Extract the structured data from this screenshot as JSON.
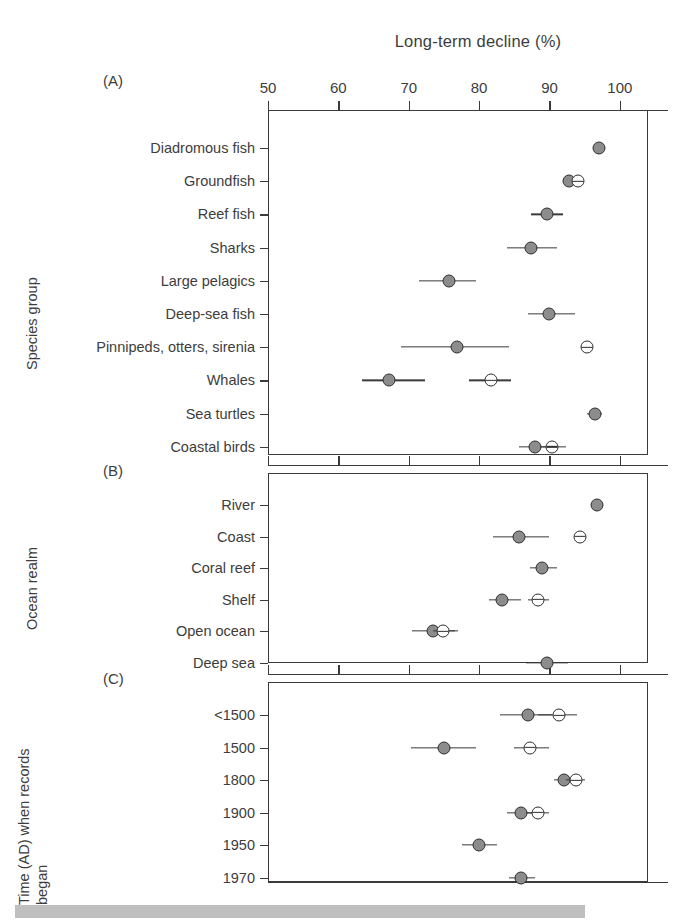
{
  "figure": {
    "title": "Long-term decline (%)",
    "panel_tags": {
      "a": "(A)",
      "b": "(B)",
      "c": "(C)"
    },
    "axis_titles": {
      "a": "Species group",
      "b": "Ocean realm",
      "c_line1": "Time (AD) when records",
      "c_line2": "began"
    }
  },
  "chart_data": {
    "type": "scatter",
    "title": "Long-term decline (%)",
    "xlabel": "Long-term decline (%)",
    "ylabel": "",
    "xlim": [
      50,
      104
    ],
    "xticks": [
      50,
      60,
      70,
      80,
      90,
      100
    ],
    "xtick_labels": [
      "50",
      "60",
      "70",
      "80",
      "90",
      "100"
    ],
    "grid": false,
    "legend": [
      {
        "name": "filled circle",
        "marker": "filled",
        "color": "#8c8c8c"
      },
      {
        "name": "open circle",
        "marker": "open",
        "color": "#ffffff"
      }
    ],
    "panels": [
      {
        "tag": "(A)",
        "ylabel": "Species group",
        "categories": [
          "Diadromous fish",
          "Groundfish",
          "Reef fish",
          "Sharks",
          "Large pelagics",
          "Deep-sea fish",
          "Pinnipeds, otters, sirenia",
          "Whales",
          "Sea turtles",
          "Coastal birds"
        ],
        "series": [
          {
            "name": "filled",
            "points": [
              {
                "category": "Diadromous fish",
                "value": 97.0,
                "lo": 97.0,
                "hi": 97.0
              },
              {
                "category": "Groundfish",
                "value": 92.8,
                "lo": 92.8,
                "hi": 92.8
              },
              {
                "category": "Reef fish",
                "value": 89.6,
                "lo": 87.4,
                "hi": 91.9
              },
              {
                "category": "Sharks",
                "value": 87.4,
                "lo": 83.9,
                "hi": 91.0
              },
              {
                "category": "Large pelagics",
                "value": 75.7,
                "lo": 71.4,
                "hi": 79.6
              },
              {
                "category": "Deep-sea fish",
                "value": 89.9,
                "lo": 87.0,
                "hi": 93.6
              },
              {
                "category": "Pinnipeds, otters, sirenia",
                "value": 76.9,
                "lo": 68.9,
                "hi": 84.3
              },
              {
                "category": "Whales",
                "value": 67.2,
                "lo": 63.4,
                "hi": 72.3
              },
              {
                "category": "Sea turtles",
                "value": 96.4,
                "lo": 95.4,
                "hi": 97.4
              },
              {
                "category": "Coastal birds",
                "value": 88.0,
                "lo": 85.7,
                "hi": 90.0
              }
            ]
          },
          {
            "name": "open",
            "points": [
              {
                "category": "Groundfish",
                "value": 94.0,
                "lo": 94.0,
                "hi": 94.0
              },
              {
                "category": "Pinnipeds, otters, sirenia",
                "value": 95.4,
                "lo": 95.4,
                "hi": 95.4
              },
              {
                "category": "Whales",
                "value": 81.7,
                "lo": 78.6,
                "hi": 84.6
              },
              {
                "category": "Coastal birds",
                "value": 90.4,
                "lo": 88.6,
                "hi": 92.4
              }
            ]
          }
        ]
      },
      {
        "tag": "(B)",
        "ylabel": "Ocean realm",
        "categories": [
          "River",
          "Coast",
          "Coral reef",
          "Shelf",
          "Open ocean",
          "Deep sea"
        ],
        "series": [
          {
            "name": "filled",
            "points": [
              {
                "category": "River",
                "value": 96.7,
                "lo": 96.7,
                "hi": 96.7
              },
              {
                "category": "Coast",
                "value": 85.7,
                "lo": 82.0,
                "hi": 90.0
              },
              {
                "category": "Coral reef",
                "value": 89.0,
                "lo": 87.3,
                "hi": 91.1
              },
              {
                "category": "Shelf",
                "value": 83.3,
                "lo": 81.4,
                "hi": 86.0
              },
              {
                "category": "Open ocean",
                "value": 73.4,
                "lo": 70.4,
                "hi": 76.6
              },
              {
                "category": "Deep sea",
                "value": 89.6,
                "lo": 86.6,
                "hi": 92.6
              }
            ]
          },
          {
            "name": "open",
            "points": [
              {
                "category": "Coast",
                "value": 94.3,
                "lo": 94.3,
                "hi": 94.3
              },
              {
                "category": "Shelf",
                "value": 88.4,
                "lo": 87.0,
                "hi": 90.0
              },
              {
                "category": "Open ocean",
                "value": 74.9,
                "lo": 73.4,
                "hi": 77.0
              }
            ]
          }
        ]
      },
      {
        "tag": "(C)",
        "ylabel": "Time (AD) when records began",
        "categories": [
          "<1500",
          "1500",
          "1800",
          "1900",
          "1950",
          "1970"
        ],
        "series": [
          {
            "name": "filled",
            "points": [
              {
                "category": "<1500",
                "value": 87.0,
                "lo": 83.0,
                "hi": 90.3
              },
              {
                "category": "1500",
                "value": 75.0,
                "lo": 70.3,
                "hi": 79.6
              },
              {
                "category": "1800",
                "value": 92.0,
                "lo": 90.6,
                "hi": 93.6
              },
              {
                "category": "1900",
                "value": 86.0,
                "lo": 84.0,
                "hi": 88.0
              },
              {
                "category": "1950",
                "value": 80.0,
                "lo": 77.6,
                "hi": 82.6
              },
              {
                "category": "1970",
                "value": 86.0,
                "lo": 84.3,
                "hi": 88.0
              }
            ]
          },
          {
            "name": "open",
            "points": [
              {
                "category": "<1500",
                "value": 91.4,
                "lo": 88.3,
                "hi": 93.9
              },
              {
                "category": "1500",
                "value": 87.3,
                "lo": 85.0,
                "hi": 90.0
              },
              {
                "category": "1800",
                "value": 93.7,
                "lo": 92.4,
                "hi": 95.0
              },
              {
                "category": "1900",
                "value": 88.4,
                "lo": 86.7,
                "hi": 90.0
              }
            ]
          }
        ]
      }
    ]
  }
}
